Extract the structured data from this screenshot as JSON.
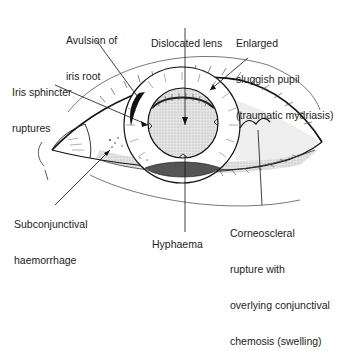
{
  "diagram": {
    "labels": {
      "avulsion": [
        "Avulsion of",
        "iris root"
      ],
      "dislocated_lens": [
        "Dislocated lens"
      ],
      "enlarged_pupil": [
        "Enlarged",
        "sluggish pupil",
        "(traumatic mydriasis)"
      ],
      "iris_sphincter": [
        "Iris sphincter",
        "ruptures"
      ],
      "subconjunctival": [
        "Subconjunctival",
        "haemorrhage"
      ],
      "hyphaema": [
        "Hyphaema"
      ],
      "corneoscleral": [
        "Corneoscleral",
        "rupture with",
        "overlying conjunctival",
        "chemosis (swelling)"
      ]
    },
    "colors": {
      "line": "#1a1a1a",
      "shade": "#d6d6d6",
      "background": "#ffffff"
    }
  }
}
